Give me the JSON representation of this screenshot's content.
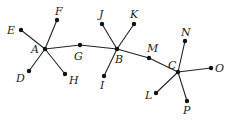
{
  "diagram": {
    "type": "tree-graph",
    "nodes": [
      {
        "id": "A",
        "label": "A",
        "x": 45,
        "y": 49,
        "lx": 31,
        "ly": 53
      },
      {
        "id": "B",
        "label": "B",
        "x": 117,
        "y": 49,
        "lx": 115,
        "ly": 63
      },
      {
        "id": "C",
        "label": "C",
        "x": 178,
        "y": 72,
        "lx": 168,
        "ly": 69
      },
      {
        "id": "D",
        "label": "D",
        "x": 29,
        "y": 71,
        "lx": 16,
        "ly": 82
      },
      {
        "id": "E",
        "label": "E",
        "x": 21,
        "y": 30,
        "lx": 7,
        "ly": 34
      },
      {
        "id": "F",
        "label": "F",
        "x": 57,
        "y": 20,
        "lx": 55,
        "ly": 15
      },
      {
        "id": "G",
        "label": "G",
        "x": 80,
        "y": 45,
        "lx": 74,
        "ly": 60
      },
      {
        "id": "H",
        "label": "H",
        "x": 65,
        "y": 74,
        "lx": 69,
        "ly": 84
      },
      {
        "id": "I",
        "label": "I",
        "x": 104,
        "y": 76,
        "lx": 100,
        "ly": 89
      },
      {
        "id": "J",
        "label": "J",
        "x": 102,
        "y": 24,
        "lx": 99,
        "ly": 18
      },
      {
        "id": "K",
        "label": "K",
        "x": 134,
        "y": 24,
        "lx": 130,
        "ly": 18
      },
      {
        "id": "L",
        "label": "L",
        "x": 156,
        "y": 93,
        "lx": 145,
        "ly": 99
      },
      {
        "id": "M",
        "label": "M",
        "x": 149,
        "y": 58,
        "lx": 147,
        "ly": 52
      },
      {
        "id": "N",
        "label": "N",
        "x": 185,
        "y": 41,
        "lx": 181,
        "ly": 36
      },
      {
        "id": "O",
        "label": "O",
        "x": 211,
        "y": 68,
        "lx": 215,
        "ly": 72
      },
      {
        "id": "P",
        "label": "P",
        "x": 187,
        "y": 101,
        "lx": 183,
        "ly": 114
      }
    ],
    "edges": [
      [
        "A",
        "E"
      ],
      [
        "A",
        "F"
      ],
      [
        "A",
        "D"
      ],
      [
        "A",
        "H"
      ],
      [
        "A",
        "G"
      ],
      [
        "G",
        "B"
      ],
      [
        "B",
        "J"
      ],
      [
        "B",
        "K"
      ],
      [
        "B",
        "I"
      ],
      [
        "B",
        "M"
      ],
      [
        "M",
        "C"
      ],
      [
        "C",
        "N"
      ],
      [
        "C",
        "O"
      ],
      [
        "C",
        "L"
      ],
      [
        "C",
        "P"
      ]
    ]
  }
}
